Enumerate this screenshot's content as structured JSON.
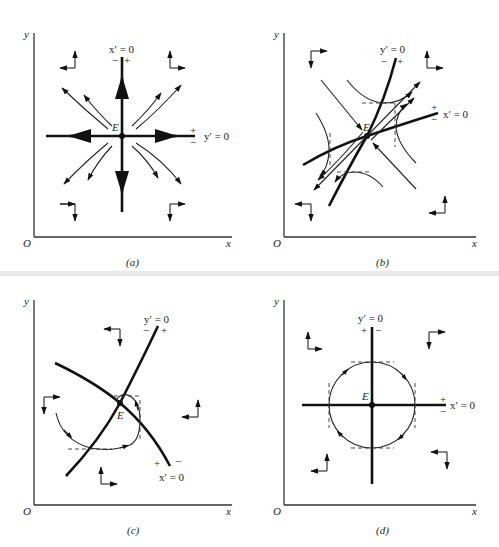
{
  "figure": {
    "panels": [
      {
        "id": "a",
        "caption": "(a)",
        "axis_labels": {
          "origin": "O",
          "x": "x",
          "y": "y"
        },
        "equilibrium_label": "E",
        "nullclines": [
          {
            "label": "x′ = 0",
            "signs": [
              "−",
              "+"
            ],
            "orientation": "vertical line"
          },
          {
            "label": "y′ = 0",
            "signs": [
              "+",
              "−"
            ],
            "orientation": "horizontal line"
          }
        ],
        "type": "unstable node"
      },
      {
        "id": "b",
        "caption": "(b)",
        "axis_labels": {
          "origin": "O",
          "x": "x",
          "y": "y"
        },
        "equilibrium_label": "E",
        "nullclines": [
          {
            "label": "y′ = 0",
            "signs": [
              "−",
              "+"
            ],
            "orientation": "steep increasing curve"
          },
          {
            "label": "x′ = 0",
            "signs": [
              "+",
              "−"
            ],
            "orientation": "shallow increasing curve"
          }
        ],
        "type": "saddle point"
      },
      {
        "id": "c",
        "caption": "(c)",
        "axis_labels": {
          "origin": "O",
          "x": "x",
          "y": "y"
        },
        "equilibrium_label": "E",
        "nullclines": [
          {
            "label": "y′ = 0",
            "signs": [
              "−",
              "+"
            ],
            "orientation": "increasing curve"
          },
          {
            "label": "x′ = 0",
            "signs": [
              "+",
              "−"
            ],
            "orientation": "decreasing curve"
          }
        ],
        "type": "spiral"
      },
      {
        "id": "d",
        "caption": "(d)",
        "axis_labels": {
          "origin": "O",
          "x": "x",
          "y": "y"
        },
        "equilibrium_label": "E",
        "nullclines": [
          {
            "label": "y′ = 0",
            "signs": [
              "+",
              "−"
            ],
            "orientation": "vertical line"
          },
          {
            "label": "x′ = 0",
            "signs": [
              "+",
              "−"
            ],
            "orientation": "horizontal line"
          }
        ],
        "type": "center"
      }
    ]
  }
}
